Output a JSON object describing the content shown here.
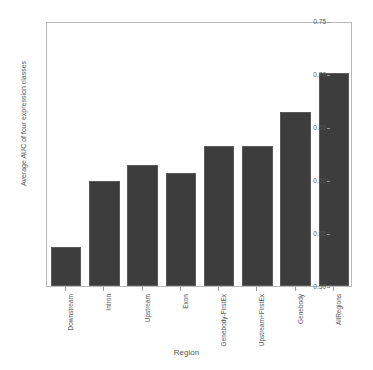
{
  "chart_data": {
    "type": "bar",
    "title": "",
    "xlabel": "Region",
    "ylabel": "Average AUC of four expression classes",
    "categories": [
      "Downstream",
      "Intron",
      "Upstream",
      "Exon",
      "Genebody-FirstEx",
      "Upstream+FirstEx",
      "Genebody",
      "AllRegions"
    ],
    "values": [
      0.537,
      0.599,
      0.614,
      0.607,
      0.632,
      0.632,
      0.664,
      0.701
    ],
    "ylim": [
      0.5,
      0.75
    ],
    "yticks": [
      "0.50",
      "0.55",
      "0.60",
      "0.65",
      "0.70",
      "0.75"
    ],
    "ytick_values": [
      0.5,
      0.55,
      0.6,
      0.65,
      0.7,
      0.75
    ],
    "grid": false,
    "legend": "none",
    "bar_color": "#3d3d3d",
    "background_color": "#ffffff",
    "axis_color": "#b9b9b9"
  }
}
